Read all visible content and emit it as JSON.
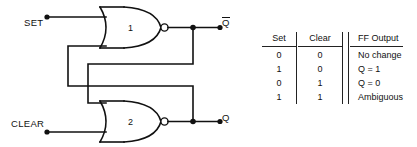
{
  "diagram": {
    "inputs": [
      {
        "name": "set",
        "label": "SET"
      },
      {
        "name": "clear",
        "label": "CLEAR"
      }
    ],
    "outputs": [
      {
        "name": "qbar",
        "label": "Q",
        "overline": true
      },
      {
        "name": "q",
        "label": "Q",
        "overline": false
      }
    ],
    "gates": [
      {
        "name": "gate-1",
        "number": "1",
        "type": "NOR"
      },
      {
        "name": "gate-2",
        "number": "2",
        "type": "NOR"
      }
    ],
    "line_color": "#111111"
  },
  "truth_table": {
    "headers": [
      "Set",
      "Clear",
      "FF Output"
    ],
    "rows": [
      {
        "set": "0",
        "clear": "0",
        "output": "No change"
      },
      {
        "set": "1",
        "clear": "0",
        "output": "Q = 1"
      },
      {
        "set": "0",
        "clear": "1",
        "output": "Q = 0"
      },
      {
        "set": "1",
        "clear": "1",
        "output": "Ambiguous"
      }
    ]
  }
}
